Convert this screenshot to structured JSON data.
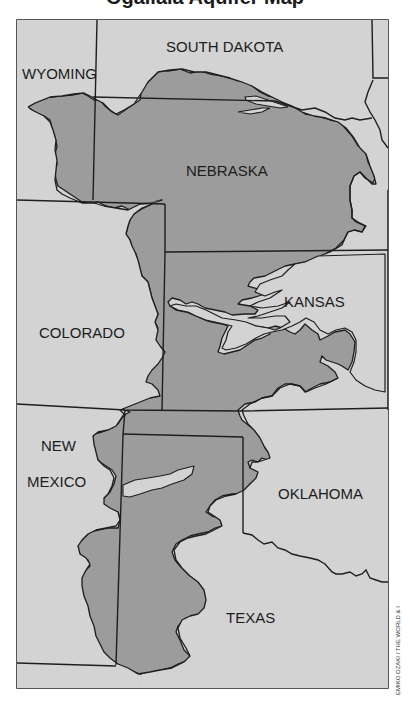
{
  "title": "Ogallala Aquifer Map",
  "colors": {
    "background": "#ffffff",
    "land": "#d3d3d3",
    "aquifer": "#9c9c9c",
    "border": "#1e1e1e"
  },
  "legend_hint": "Shaded area indicates extent of the aquifer",
  "states": [
    {
      "id": "south-dakota",
      "label": "SOUTH DAKOTA"
    },
    {
      "id": "wyoming",
      "label": "WYOMING"
    },
    {
      "id": "nebraska",
      "label": "NEBRASKA"
    },
    {
      "id": "colorado",
      "label": "COLORADO"
    },
    {
      "id": "kansas",
      "label": "KANSAS"
    },
    {
      "id": "new-mexico",
      "label_line1": "NEW",
      "label_line2": "MEXICO"
    },
    {
      "id": "oklahoma",
      "label": "OKLAHOMA"
    },
    {
      "id": "texas",
      "label": "TEXAS"
    }
  ],
  "credit": "EMIKO OZAKI / THE WORLD & I"
}
